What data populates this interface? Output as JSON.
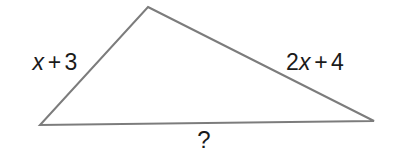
{
  "figure": {
    "type": "triangle-diagram",
    "background_color": "#ffffff",
    "stroke_color": "#7c7c7c",
    "stroke_width": 2,
    "text_color": "#1a1a1a",
    "vertices": {
      "apex": {
        "x": 148,
        "y": 7
      },
      "bottom_left": {
        "x": 40,
        "y": 125
      },
      "bottom_right": {
        "x": 374,
        "y": 121
      }
    },
    "labels": {
      "left_side": {
        "full_text": "x + 3",
        "coefficient": "",
        "variable": "x",
        "operator": "+",
        "constant": "3"
      },
      "right_side": {
        "full_text": "2x + 4",
        "coefficient": "2",
        "variable": "x",
        "operator": "+",
        "constant": "4"
      },
      "base": {
        "full_text": "?"
      }
    }
  }
}
